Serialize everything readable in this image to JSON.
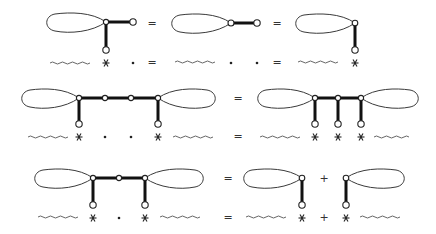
{
  "diagram": {
    "rows": [
      {
        "top": {
          "terms": [
            "loop-with-T-junction",
            "loop-with-horizontal-leg",
            "loop-with-vertical-leg"
          ],
          "operators": [
            "=",
            "="
          ]
        },
        "bottom": {
          "symbols": [
            "wavy",
            "*",
            "•",
            "=",
            "wavy",
            "•",
            "•",
            "=",
            "wavy",
            "*"
          ]
        }
      },
      {
        "top": {
          "terms": [
            "double-loop-chain-4-vertices-2-legs",
            "double-loop-3-vertices-3-legs"
          ],
          "operators": [
            "="
          ]
        },
        "bottom": {
          "symbols": [
            "wavy",
            "*",
            "•",
            "•",
            "*",
            "wavy",
            "=",
            "wavy",
            "*",
            "*",
            "*",
            "wavy"
          ]
        }
      },
      {
        "top": {
          "terms": [
            "double-loop-3-vertices-2-legs",
            "left-loop-with-leg",
            "right-loop-with-leg"
          ],
          "operators": [
            "=",
            "+"
          ]
        },
        "bottom": {
          "symbols": [
            "wavy",
            "*",
            "•",
            "*",
            "wavy",
            "=",
            "wavy",
            "*",
            "+",
            "*",
            "wavy"
          ]
        }
      }
    ],
    "operators": {
      "equals": "=",
      "plus": "+"
    },
    "colors": {
      "line": "#111111",
      "loop": "#3a3a3a",
      "background": "#ffffff"
    }
  }
}
